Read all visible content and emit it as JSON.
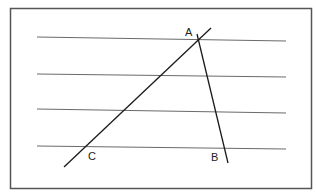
{
  "diagram": {
    "type": "geometry",
    "frame": {
      "x": 10.5,
      "y": 8.5,
      "width": 301,
      "height": 180,
      "stroke": "#555555"
    },
    "parallel_lines": [
      {
        "x1": 37,
        "y1": 37,
        "x2": 286,
        "y2": 41
      },
      {
        "x1": 37,
        "y1": 74,
        "x2": 286,
        "y2": 77
      },
      {
        "x1": 37,
        "y1": 109,
        "x2": 286,
        "y2": 113
      },
      {
        "x1": 37,
        "y1": 146,
        "x2": 286,
        "y2": 149
      }
    ],
    "transversals": [
      {
        "name": "AC",
        "x1": 211,
        "y1": 28,
        "x2": 64,
        "y2": 167
      },
      {
        "name": "AB",
        "x1": 197,
        "y1": 34,
        "x2": 228,
        "y2": 163
      }
    ],
    "labels": [
      {
        "text": "A",
        "x": 185,
        "y": 36
      },
      {
        "text": "C",
        "x": 88,
        "y": 160
      },
      {
        "text": "B",
        "x": 211,
        "y": 161
      }
    ],
    "colors": {
      "parallel": "#6a6a6a",
      "transversal": "#1a1a1a",
      "frame": "#555555"
    }
  }
}
